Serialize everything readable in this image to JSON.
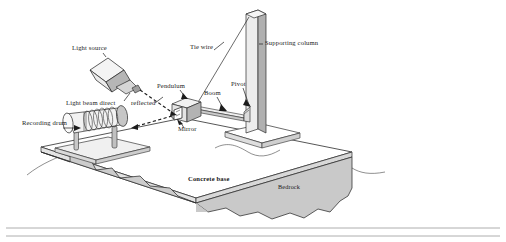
{
  "figure": {
    "kind": "seismograph-diagram",
    "title_visible": false,
    "labels": [
      {
        "id": "light-source",
        "text": "Light source",
        "x": 72,
        "y": 50
      },
      {
        "id": "tie-wire",
        "text": "Tie wire",
        "x": 190,
        "y": 49
      },
      {
        "id": "supporting-column",
        "text": "Supporting column",
        "x": 265,
        "y": 45
      },
      {
        "id": "pendulum",
        "text": "Pendulum",
        "x": 157,
        "y": 88
      },
      {
        "id": "boom",
        "text": "Boom",
        "x": 204,
        "y": 95
      },
      {
        "id": "pivot",
        "text": "Pivot",
        "x": 231,
        "y": 86
      },
      {
        "id": "light-beam-direct",
        "text": "Light beam direct",
        "x": 66,
        "y": 105
      },
      {
        "id": "reflected",
        "text": "reflected",
        "x": 131,
        "y": 105
      },
      {
        "id": "recording-drum",
        "text": "Recording drum",
        "x": 22,
        "y": 125
      },
      {
        "id": "mirror",
        "text": "Mirror",
        "x": 178,
        "y": 131
      },
      {
        "id": "concrete-base",
        "text": "Concrete base",
        "x": 188,
        "y": 181
      },
      {
        "id": "bedrock",
        "text": "Bedrock",
        "x": 278,
        "y": 189
      }
    ],
    "colors": {
      "ink": "#1c1c1c",
      "paper": "#ffffff",
      "slab_top": "#ffffff",
      "slab_side": "#c9c9c9",
      "column_light": "#e6e6e6",
      "column_shade": "#b4b4b4",
      "drum_body": "#f0f0f0",
      "drum_shade": "#c2c2c2",
      "box_shade": "#b9b9b9",
      "rule": "#9a9a9a"
    }
  }
}
